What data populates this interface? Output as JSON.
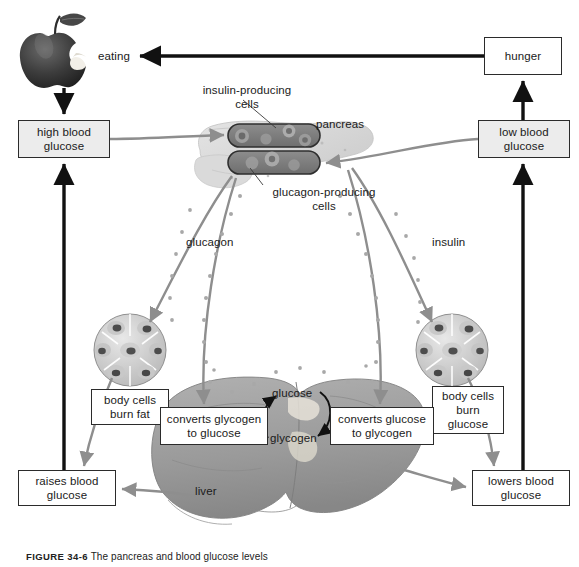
{
  "figure": {
    "caption_label": "FIGURE 34-6",
    "caption_text": "The pancreas and blood glucose levels"
  },
  "boxes": [
    {
      "name": "hunger",
      "label": "hunger",
      "style": "plain",
      "x": 484,
      "y": 37,
      "w": 78,
      "h": 38
    },
    {
      "name": "high-blood-glucose",
      "label": "high blood\nglucose",
      "style": "filled",
      "x": 18,
      "y": 120,
      "w": 92,
      "h": 38
    },
    {
      "name": "low-blood-glucose",
      "label": "low blood\nglucose",
      "style": "filled",
      "x": 478,
      "y": 120,
      "w": 92,
      "h": 38
    },
    {
      "name": "body-cells-burn-fat",
      "label": "body cells\nburn fat",
      "style": "plain",
      "x": 91,
      "y": 389,
      "w": 78,
      "h": 36
    },
    {
      "name": "body-cells-burn-glucose",
      "label": "body cells\nburn\nglucose",
      "style": "plain",
      "x": 432,
      "y": 386,
      "w": 72,
      "h": 48
    },
    {
      "name": "converts-glycogen-to-glucose",
      "label": "converts glycogen\nto glucose",
      "style": "plain",
      "x": 160,
      "y": 407,
      "w": 108,
      "h": 38
    },
    {
      "name": "converts-glucose-to-glycogen",
      "label": "converts glucose\nto glycogen",
      "style": "plain",
      "x": 330,
      "y": 407,
      "w": 104,
      "h": 38
    },
    {
      "name": "raises-blood-glucose",
      "label": "raises blood\nglucose",
      "style": "plain",
      "x": 18,
      "y": 470,
      "w": 98,
      "h": 36
    },
    {
      "name": "lowers-blood-glucose",
      "label": "lowers blood\nglucose",
      "style": "plain",
      "x": 472,
      "y": 470,
      "w": 98,
      "h": 36
    }
  ],
  "labels": [
    {
      "name": "eating-label",
      "text": "eating",
      "x": 98,
      "y": 50,
      "w": 48,
      "align": "left"
    },
    {
      "name": "insulin-producing-cells-label",
      "text": "insulin-producing\ncells",
      "x": 195,
      "y": 84,
      "w": 104,
      "align": "center"
    },
    {
      "name": "pancreas-label",
      "text": "pancreas",
      "x": 316,
      "y": 118,
      "w": 58,
      "align": "left"
    },
    {
      "name": "glucagon-producing-cells-label",
      "text": "glucagon-producing\ncells",
      "x": 268,
      "y": 186,
      "w": 112,
      "align": "center"
    },
    {
      "name": "glucagon-label",
      "text": "glucagon",
      "x": 186,
      "y": 236,
      "w": 56,
      "align": "left"
    },
    {
      "name": "insulin-label",
      "text": "insulin",
      "x": 432,
      "y": 236,
      "w": 44,
      "align": "left"
    },
    {
      "name": "glucose-label",
      "text": "glucose",
      "x": 272,
      "y": 387,
      "w": 52,
      "align": "left"
    },
    {
      "name": "glycogen-label",
      "text": "glycogen",
      "x": 270,
      "y": 432,
      "w": 56,
      "align": "left"
    },
    {
      "name": "liver-label",
      "text": "liver",
      "x": 195,
      "y": 485,
      "w": 34,
      "align": "left"
    }
  ],
  "colors": {
    "box_fill_active": "#ececec",
    "box_fill_plain": "#ffffff",
    "box_border": "#2b2b2b",
    "black_arrow": "#111111",
    "hormone_arrow": "#8e8e8e",
    "hormone_particle": "#a8a8a8",
    "organ_gray": "#9a9a9a",
    "liver_gray": "#9d9d9d",
    "pancreas_pale": "#dcdcdc",
    "islet_dark": "#7c7c7c",
    "apple_dark": "#3a3a3a",
    "text": "#1a1a1a"
  }
}
